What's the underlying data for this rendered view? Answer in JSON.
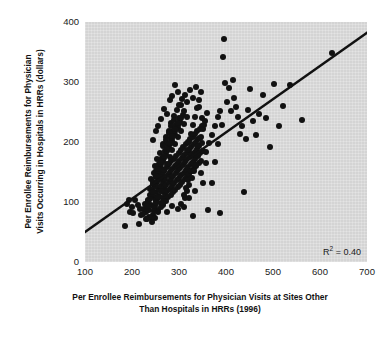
{
  "chart_data": {
    "type": "scatter",
    "title": "",
    "xlabel": "Per Enrollee Reimbursements for Physician Visits at Sites Other Than Hospitals in HRRs (1996)",
    "xlabel_line1": "Per Enrollee Reimbursements for Physician Visits at Sites Other",
    "xlabel_line2": "Than Hospitals in HRRs (1996)",
    "ylabel": "Per Enrollee Reimbursements for Physician Visits Occurring in Hospitals in HRRs (dollars)",
    "ylabel_line1": "Per Enrollee Reimbursements for Physician",
    "ylabel_line2": "Visits Occurring in Hospitals in HRRs (dollars)",
    "xlim": [
      100,
      700
    ],
    "ylim": [
      0,
      400
    ],
    "xticks": [
      100,
      200,
      300,
      400,
      500,
      600,
      700
    ],
    "yticks": [
      0,
      100,
      200,
      300,
      400
    ],
    "xtick_labels": [
      "100",
      "200",
      "300",
      "400",
      "500",
      "600",
      "700"
    ],
    "ytick_labels": [
      "0",
      "100",
      "200",
      "300",
      "400"
    ],
    "grid": false,
    "legend": "none",
    "plot_background_color": "#d4d4d4",
    "page_background_color": "#ffffff",
    "marker_color": "#111111",
    "marker_size_px": 6,
    "annotations": [
      {
        "name": "r-squared",
        "text_prefix": "R",
        "text_superscript": "2",
        "text_suffix": " = 0.40",
        "value": 0.4,
        "position": "bottom-right-inside-axes"
      }
    ],
    "trendline": {
      "type": "linear-fit",
      "color": "#111111",
      "width_px": 2.4,
      "x_start": 100,
      "y_start": 50,
      "x_end": 700,
      "y_end": 382
    },
    "points": [
      [
        186,
        60
      ],
      [
        196,
        83
      ],
      [
        203,
        82
      ],
      [
        214,
        63
      ],
      [
        220,
        78
      ],
      [
        226,
        88
      ],
      [
        228,
        96
      ],
      [
        231,
        72
      ],
      [
        233,
        104
      ],
      [
        236,
        86
      ],
      [
        238,
        112
      ],
      [
        240,
        95
      ],
      [
        242,
        120
      ],
      [
        244,
        79
      ],
      [
        246,
        108
      ],
      [
        248,
        128
      ],
      [
        249,
        93
      ],
      [
        251,
        116
      ],
      [
        252,
        101
      ],
      [
        254,
        134
      ],
      [
        255,
        87
      ],
      [
        257,
        122
      ],
      [
        258,
        110
      ],
      [
        260,
        141
      ],
      [
        261,
        99
      ],
      [
        262,
        127
      ],
      [
        263,
        118
      ],
      [
        264,
        147
      ],
      [
        265,
        106
      ],
      [
        266,
        133
      ],
      [
        267,
        95
      ],
      [
        268,
        124
      ],
      [
        269,
        152
      ],
      [
        270,
        113
      ],
      [
        271,
        139
      ],
      [
        272,
        101
      ],
      [
        273,
        129
      ],
      [
        274,
        158
      ],
      [
        275,
        118
      ],
      [
        276,
        145
      ],
      [
        277,
        108
      ],
      [
        278,
        134
      ],
      [
        279,
        163
      ],
      [
        280,
        122
      ],
      [
        281,
        150
      ],
      [
        282,
        112
      ],
      [
        283,
        138
      ],
      [
        284,
        168
      ],
      [
        285,
        127
      ],
      [
        286,
        155
      ],
      [
        287,
        116
      ],
      [
        288,
        143
      ],
      [
        289,
        172
      ],
      [
        290,
        131
      ],
      [
        291,
        160
      ],
      [
        292,
        120
      ],
      [
        293,
        148
      ],
      [
        294,
        177
      ],
      [
        295,
        136
      ],
      [
        296,
        164
      ],
      [
        297,
        125
      ],
      [
        298,
        153
      ],
      [
        299,
        182
      ],
      [
        300,
        140
      ],
      [
        301,
        169
      ],
      [
        302,
        129
      ],
      [
        303,
        157
      ],
      [
        304,
        187
      ],
      [
        305,
        145
      ],
      [
        306,
        173
      ],
      [
        307,
        133
      ],
      [
        308,
        162
      ],
      [
        309,
        191
      ],
      [
        310,
        149
      ],
      [
        311,
        178
      ],
      [
        312,
        138
      ],
      [
        313,
        166
      ],
      [
        314,
        196
      ],
      [
        315,
        154
      ],
      [
        316,
        182
      ],
      [
        317,
        142
      ],
      [
        318,
        171
      ],
      [
        319,
        200
      ],
      [
        320,
        158
      ],
      [
        321,
        187
      ],
      [
        322,
        147
      ],
      [
        323,
        175
      ],
      [
        324,
        205
      ],
      [
        325,
        163
      ],
      [
        326,
        191
      ],
      [
        327,
        151
      ],
      [
        328,
        180
      ],
      [
        329,
        209
      ],
      [
        330,
        167
      ],
      [
        331,
        196
      ],
      [
        332,
        156
      ],
      [
        333,
        184
      ],
      [
        334,
        214
      ],
      [
        335,
        172
      ],
      [
        336,
        200
      ],
      [
        337,
        160
      ],
      [
        338,
        189
      ],
      [
        339,
        218
      ],
      [
        340,
        176
      ],
      [
        341,
        205
      ],
      [
        342,
        165
      ],
      [
        343,
        193
      ],
      [
        344,
        222
      ],
      [
        345,
        181
      ],
      [
        346,
        209
      ],
      [
        347,
        169
      ],
      [
        348,
        198
      ],
      [
        349,
        227
      ],
      [
        350,
        185
      ],
      [
        252,
        152
      ],
      [
        258,
        163
      ],
      [
        264,
        174
      ],
      [
        270,
        185
      ],
      [
        276,
        196
      ],
      [
        282,
        207
      ],
      [
        288,
        218
      ],
      [
        294,
        229
      ],
      [
        300,
        240
      ],
      [
        266,
        196
      ],
      [
        272,
        208
      ],
      [
        278,
        219
      ],
      [
        284,
        231
      ],
      [
        290,
        243
      ],
      [
        296,
        254
      ],
      [
        240,
        138
      ],
      [
        246,
        149
      ],
      [
        252,
        127
      ],
      [
        258,
        138
      ],
      [
        264,
        149
      ],
      [
        243,
        116
      ],
      [
        249,
        127
      ],
      [
        255,
        107
      ],
      [
        261,
        118
      ],
      [
        234,
        101
      ],
      [
        240,
        112
      ],
      [
        246,
        92
      ],
      [
        252,
        103
      ],
      [
        229,
        84
      ],
      [
        235,
        95
      ],
      [
        241,
        74
      ],
      [
        247,
        85
      ],
      [
        255,
        146
      ],
      [
        261,
        157
      ],
      [
        267,
        168
      ],
      [
        273,
        179
      ],
      [
        279,
        190
      ],
      [
        285,
        201
      ],
      [
        291,
        212
      ],
      [
        297,
        223
      ],
      [
        303,
        234
      ],
      [
        309,
        245
      ],
      [
        262,
        142
      ],
      [
        268,
        153
      ],
      [
        274,
        164
      ],
      [
        280,
        175
      ],
      [
        286,
        186
      ],
      [
        292,
        197
      ],
      [
        298,
        208
      ],
      [
        304,
        219
      ],
      [
        310,
        230
      ],
      [
        316,
        241
      ],
      [
        248,
        160
      ],
      [
        254,
        171
      ],
      [
        260,
        182
      ],
      [
        266,
        193
      ],
      [
        272,
        204
      ],
      [
        278,
        215
      ],
      [
        284,
        226
      ],
      [
        290,
        237
      ],
      [
        244,
        130
      ],
      [
        250,
        141
      ],
      [
        256,
        152
      ],
      [
        262,
        163
      ],
      [
        268,
        174
      ],
      [
        274,
        185
      ],
      [
        280,
        196
      ],
      [
        286,
        207
      ],
      [
        292,
        218
      ],
      [
        298,
        229
      ],
      [
        304,
        240
      ],
      [
        310,
        251
      ],
      [
        238,
        122
      ],
      [
        244,
        133
      ],
      [
        250,
        144
      ],
      [
        256,
        155
      ],
      [
        262,
        166
      ],
      [
        268,
        177
      ],
      [
        274,
        188
      ],
      [
        280,
        199
      ],
      [
        286,
        210
      ],
      [
        292,
        221
      ],
      [
        298,
        232
      ],
      [
        232,
        94
      ],
      [
        238,
        105
      ],
      [
        244,
        116
      ],
      [
        250,
        98
      ],
      [
        256,
        109
      ],
      [
        262,
        91
      ],
      [
        268,
        102
      ],
      [
        318,
        186
      ],
      [
        322,
        200
      ],
      [
        326,
        214
      ],
      [
        330,
        228
      ],
      [
        334,
        242
      ],
      [
        338,
        256
      ],
      [
        342,
        270
      ],
      [
        346,
        284
      ],
      [
        315,
        123
      ],
      [
        320,
        137
      ],
      [
        325,
        151
      ],
      [
        330,
        165
      ],
      [
        335,
        179
      ],
      [
        340,
        193
      ],
      [
        345,
        207
      ],
      [
        350,
        221
      ],
      [
        355,
        235
      ],
      [
        360,
        249
      ],
      [
        312,
        107
      ],
      [
        317,
        118
      ],
      [
        322,
        129
      ],
      [
        327,
        140
      ],
      [
        332,
        151
      ],
      [
        337,
        162
      ],
      [
        305,
        96
      ],
      [
        310,
        112
      ],
      [
        300,
        262
      ],
      [
        306,
        271
      ],
      [
        312,
        279
      ],
      [
        318,
        266
      ],
      [
        324,
        287
      ],
      [
        330,
        274
      ],
      [
        336,
        292
      ],
      [
        342,
        258
      ],
      [
        348,
        240
      ],
      [
        354,
        229
      ],
      [
        292,
        295
      ],
      [
        298,
        283
      ],
      [
        304,
        261
      ],
      [
        286,
        276
      ],
      [
        280,
        270
      ],
      [
        274,
        247
      ],
      [
        268,
        255
      ],
      [
        262,
        238
      ],
      [
        256,
        226
      ],
      [
        250,
        218
      ],
      [
        244,
        204
      ],
      [
        358,
        184
      ],
      [
        364,
        198
      ],
      [
        370,
        212
      ],
      [
        376,
        227
      ],
      [
        382,
        241
      ],
      [
        388,
        252
      ],
      [
        394,
        342
      ],
      [
        396,
        372
      ],
      [
        398,
        298
      ],
      [
        402,
        266
      ],
      [
        406,
        290
      ],
      [
        410,
        252
      ],
      [
        414,
        304
      ],
      [
        418,
        274
      ],
      [
        422,
        258
      ],
      [
        426,
        241
      ],
      [
        430,
        213
      ],
      [
        434,
        226
      ],
      [
        438,
        117
      ],
      [
        442,
        205
      ],
      [
        446,
        254
      ],
      [
        452,
        288
      ],
      [
        458,
        235
      ],
      [
        464,
        211
      ],
      [
        470,
        247
      ],
      [
        478,
        279
      ],
      [
        486,
        240
      ],
      [
        494,
        192
      ],
      [
        502,
        296
      ],
      [
        512,
        226
      ],
      [
        522,
        260
      ],
      [
        536,
        295
      ],
      [
        562,
        236
      ],
      [
        625,
        348
      ],
      [
        388,
        82
      ],
      [
        362,
        86
      ],
      [
        330,
        77
      ],
      [
        352,
        132
      ],
      [
        370,
        131
      ],
      [
        376,
        166
      ],
      [
        384,
        196
      ],
      [
        392,
        228
      ],
      [
        358,
        165
      ],
      [
        346,
        148
      ],
      [
        334,
        118
      ],
      [
        322,
        106
      ],
      [
        310,
        92
      ],
      [
        298,
        88
      ],
      [
        286,
        93
      ],
      [
        274,
        84
      ],
      [
        266,
        99
      ],
      [
        256,
        84
      ],
      [
        248,
        73
      ],
      [
        242,
        66
      ],
      [
        236,
        75
      ],
      [
        230,
        71
      ],
      [
        224,
        80
      ],
      [
        218,
        88
      ],
      [
        212,
        95
      ],
      [
        206,
        103
      ],
      [
        200,
        92
      ],
      [
        194,
        104
      ],
      [
        190,
        96
      ]
    ]
  }
}
